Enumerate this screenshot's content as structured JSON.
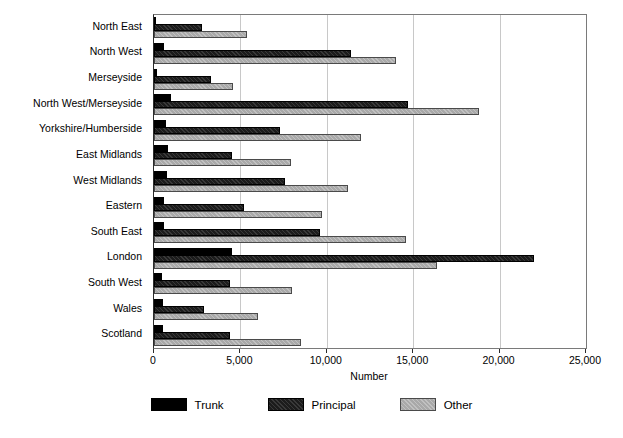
{
  "chart_data": {
    "type": "bar",
    "orientation": "horizontal",
    "title": "",
    "xlabel": "Number",
    "ylabel": "",
    "xlim": [
      0,
      25000
    ],
    "xticks": [
      0,
      5000,
      10000,
      15000,
      20000,
      25000
    ],
    "xtick_labels": [
      "0",
      "5,000",
      "10,000",
      "15,000",
      "20,000",
      "25,000"
    ],
    "grid": true,
    "grid_axis": "x",
    "legend_position": "bottom",
    "categories": [
      "North East",
      "North West",
      "Merseyside",
      "North West/Merseyside",
      "Yorkshire/Humberside",
      "East Midlands",
      "West Midlands",
      "Eastern",
      "South East",
      "London",
      "South West",
      "Wales",
      "Scotland"
    ],
    "series": [
      {
        "name": "Trunk",
        "color": "#000000",
        "values": [
          100,
          600,
          200,
          1000,
          700,
          800,
          750,
          600,
          600,
          4500,
          450,
          500,
          500
        ]
      },
      {
        "name": "Principal",
        "color": "#1c1c1c",
        "values": [
          2800,
          11400,
          3300,
          14700,
          7300,
          4500,
          7600,
          5200,
          9600,
          22000,
          4400,
          2900,
          4400
        ]
      },
      {
        "name": "Other",
        "color": "#a9a9a9",
        "values": [
          5400,
          14000,
          4600,
          18800,
          12000,
          7900,
          11200,
          9700,
          14600,
          16400,
          8000,
          6000,
          8500
        ]
      }
    ]
  },
  "legend": {
    "items": [
      {
        "label": "Trunk",
        "swatch": "trunk"
      },
      {
        "label": "Principal",
        "swatch": "principal"
      },
      {
        "label": "Other",
        "swatch": "other"
      }
    ]
  }
}
